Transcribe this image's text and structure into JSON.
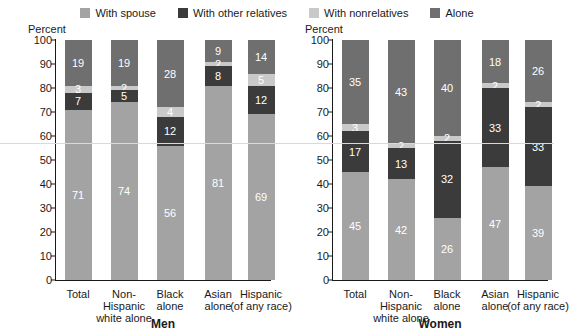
{
  "legend": {
    "items": [
      {
        "label": "With spouse",
        "color": "#a3a3a3",
        "icon": "square-swatch-icon"
      },
      {
        "label": "With other relatives",
        "color": "#3b3b3b",
        "icon": "square-swatch-icon"
      },
      {
        "label": "With nonrelatives",
        "color": "#c9c9c9",
        "icon": "square-swatch-icon"
      },
      {
        "label": "Alone",
        "color": "#6f6f6f",
        "icon": "square-swatch-icon"
      }
    ]
  },
  "axis": {
    "percent_label": "Percent",
    "ticks": [
      "100",
      "90",
      "80",
      "70",
      "60",
      "50",
      "40",
      "30",
      "20",
      "10",
      "0"
    ]
  },
  "panels": [
    {
      "id": "men",
      "title": "Men"
    },
    {
      "id": "women",
      "title": "Women"
    }
  ],
  "chart_data": [
    {
      "type": "bar",
      "stacked": true,
      "title": "Men",
      "xlabel": "",
      "ylabel": "Percent",
      "ylim": [
        0,
        100
      ],
      "ytick_step": 10,
      "grid": false,
      "legend_position": "top",
      "categories": [
        "Total",
        "Non-Hispanic white alone",
        "Black alone",
        "Asian alone",
        "Hispanic (of any race)"
      ],
      "category_lines": [
        [
          "Total",
          ""
        ],
        [
          "Non-Hispanic",
          "white alone"
        ],
        [
          "Black",
          "alone"
        ],
        [
          "Asian",
          "alone"
        ],
        [
          "Hispanic",
          "(of any race)"
        ]
      ],
      "series": [
        {
          "name": "With spouse",
          "color": "#a3a3a3",
          "values": [
            71,
            74,
            56,
            81,
            69
          ]
        },
        {
          "name": "With other relatives",
          "color": "#3b3b3b",
          "values": [
            7,
            5,
            12,
            8,
            12
          ]
        },
        {
          "name": "With nonrelatives",
          "color": "#c9c9c9",
          "values": [
            3,
            2,
            4,
            2,
            5
          ]
        },
        {
          "name": "Alone",
          "color": "#6f6f6f",
          "values": [
            19,
            19,
            28,
            9,
            14
          ]
        }
      ]
    },
    {
      "type": "bar",
      "stacked": true,
      "title": "Women",
      "xlabel": "",
      "ylabel": "Percent",
      "ylim": [
        0,
        100
      ],
      "ytick_step": 10,
      "grid": false,
      "legend_position": "top",
      "categories": [
        "Total",
        "Non-Hispanic white alone",
        "Black alone",
        "Asian alone",
        "Hispanic (of any race)"
      ],
      "category_lines": [
        [
          "Total",
          ""
        ],
        [
          "Non-Hispanic",
          "white alone"
        ],
        [
          "Black",
          "alone"
        ],
        [
          "Asian",
          "alone"
        ],
        [
          "Hispanic",
          "(of any race)"
        ]
      ],
      "series": [
        {
          "name": "With spouse",
          "color": "#a3a3a3",
          "values": [
            45,
            42,
            26,
            47,
            39
          ]
        },
        {
          "name": "With other relatives",
          "color": "#3b3b3b",
          "values": [
            17,
            13,
            32,
            33,
            33
          ]
        },
        {
          "name": "With nonrelatives",
          "color": "#c9c9c9",
          "values": [
            3,
            2,
            2,
            2,
            2
          ]
        },
        {
          "name": "Alone",
          "color": "#6f6f6f",
          "values": [
            35,
            43,
            40,
            18,
            26
          ]
        }
      ]
    }
  ]
}
